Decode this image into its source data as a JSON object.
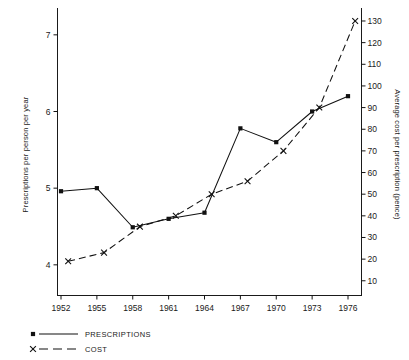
{
  "chart_data": {
    "type": "line",
    "title": "",
    "xlabel": "",
    "ylabel": "Prescriptions per person per year",
    "ylabel_right": "Average cost per prescription (pence)",
    "categories": [
      "1952",
      "1955",
      "1958",
      "1961",
      "1964",
      "1967",
      "1970",
      "1973",
      "1976"
    ],
    "x": [
      1952,
      1955,
      1958,
      1961,
      1964,
      1967,
      1970,
      1973,
      1976
    ],
    "ylim": [
      3.6,
      7.35
    ],
    "ylim_right": [
      3.2,
      136
    ],
    "yticks": [
      "4",
      "5",
      "6",
      "7"
    ],
    "yticks_right": [
      "10",
      "20",
      "30",
      "40",
      "50",
      "60",
      "70",
      "80",
      "90",
      "100",
      "110",
      "120",
      "130"
    ],
    "grid": false,
    "legend_position": "bottom-left",
    "series": [
      {
        "name": "PRESCRIPTIONS",
        "axis": "left",
        "marker": "square-dot",
        "linestyle": "solid",
        "color": "#111111",
        "values": [
          4.96,
          5.0,
          4.49,
          4.6,
          4.68,
          5.78,
          5.6,
          6.0,
          6.2
        ]
      },
      {
        "name": "COST",
        "axis": "right",
        "marker": "cross",
        "linestyle": "dashed",
        "color": "#111111",
        "x_offset_years": 0.6,
        "values": [
          19,
          23,
          35,
          40,
          50,
          56,
          70,
          90,
          130
        ]
      }
    ]
  },
  "legend": {
    "items": [
      {
        "label": "PRESCRIPTIONS",
        "marker": "square-dot",
        "linestyle": "solid"
      },
      {
        "label": "COST",
        "marker": "cross",
        "linestyle": "dashed"
      }
    ]
  },
  "colors": {
    "ink": "#111111",
    "background": "#ffffff"
  }
}
